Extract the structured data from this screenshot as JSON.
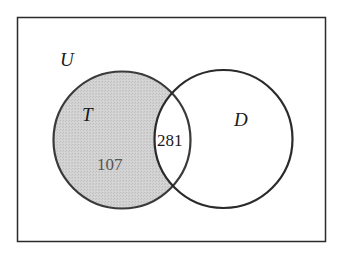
{
  "diagram": {
    "type": "venn",
    "universe": {
      "label": "U",
      "rect": {
        "x": 17.5,
        "y": 17.5,
        "width": 308,
        "height": 224
      },
      "stroke": "#2b2b2b"
    },
    "sets": [
      {
        "id": "T",
        "label": "T",
        "cx": 122,
        "cy": 140,
        "r": 68.5,
        "fill": "#cdcdcd",
        "stroke": "#3a3a3a",
        "shaded": true
      },
      {
        "id": "D",
        "label": "D",
        "cx": 223.5,
        "cy": 139,
        "r": 69,
        "fill": "none",
        "stroke": "#2a2a2a",
        "shaded": false
      }
    ],
    "regions": [
      {
        "name": "T only",
        "value": "107",
        "color": "#555555"
      },
      {
        "name": "T and D",
        "value": "281",
        "color": "#1a1a1a"
      }
    ],
    "shaded_region": "T only"
  }
}
